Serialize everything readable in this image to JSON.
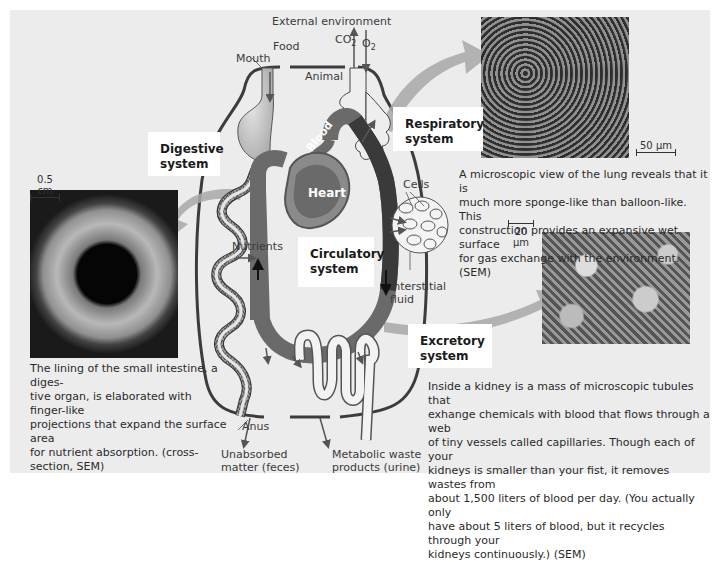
{
  "diagram": {
    "labels": {
      "external_environment": "External environment",
      "food": "Food",
      "mouth": "Mouth",
      "co2": "CO",
      "co2_sub": "2",
      "o2": "O",
      "o2_sub": "2",
      "animal": "Animal",
      "blood": "Blood",
      "heart": "Heart",
      "cells": "Cells",
      "nutrients": "Nutrients",
      "interstitial_fluid_line1": "Interstitial",
      "interstitial_fluid_line2": "fluid",
      "anus": "Anus",
      "unabsorbed_line1": "Unabsorbed",
      "unabsorbed_line2": "matter (feces)",
      "metabolic_line1": "Metabolic waste",
      "metabolic_line2": "products (urine)"
    },
    "systems": {
      "digestive_line1": "Digestive",
      "digestive_line2": "system",
      "respiratory_line1": "Respiratory",
      "respiratory_line2": "system",
      "circulatory_line1": "Circulatory",
      "circulatory_line2": "system",
      "excretory_line1": "Excretory",
      "excretory_line2": "system"
    },
    "micrographs": {
      "intestine": {
        "scale": "0.5 cm",
        "caption": "The lining of the small intestine, a digestive organ, is elaborated with finger-like projections that expand the surface area for nutrient absorption. (cross-section, SEM)",
        "caption_lines": [
          "The lining of the small intestine, a diges-",
          "tive organ, is elaborated with finger-like",
          "projections that expand the surface area",
          "for nutrient absorption. (cross-section, SEM)"
        ]
      },
      "lung": {
        "scale": "50 µm",
        "caption_lines": [
          "A microscopic view of the lung reveals that it is",
          "much more sponge-like than balloon-like. This",
          "construction provides an expansive wet surface",
          "for gas exchange with the environment. (SEM)"
        ]
      },
      "kidney": {
        "scale": "20 µm",
        "caption_lines": [
          "Inside a kidney is a mass of microscopic tubules that",
          "exhange chemicals with blood that flows through a web",
          "of tiny vessels called capillaries. Though each of your",
          "kidneys is smaller than your fist, it removes wastes from",
          "about 1,500 liters of blood per day. (You actually only",
          "have about 5 liters of blood, but it recycles through your",
          "kidneys continuously.) (SEM)"
        ]
      }
    },
    "colors": {
      "panel_bg": "#ececec",
      "blood_vessel": "#6a6a6a",
      "blood_dark": "#3a3a3a",
      "organ_fill": "#d8d8d8",
      "arrow_gray": "#a8a8a8",
      "body_outline": "#3c3c3c"
    }
  }
}
